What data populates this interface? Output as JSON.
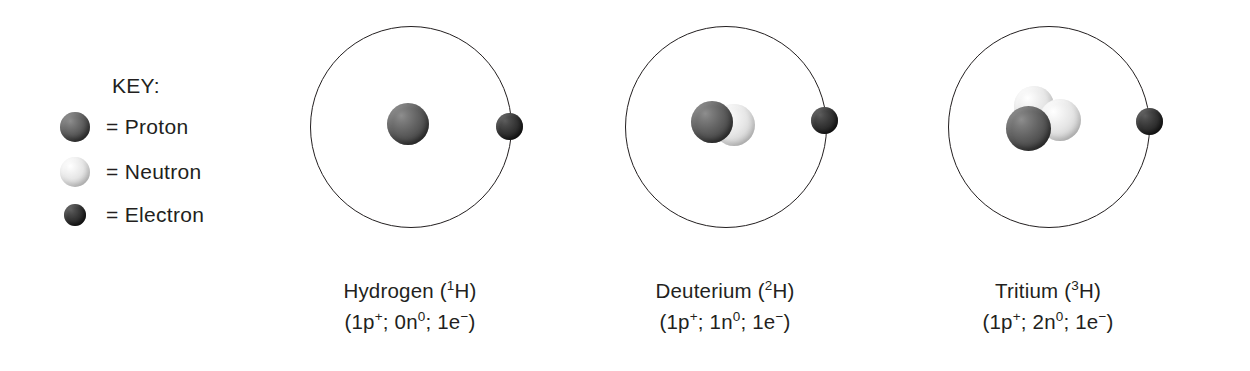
{
  "figure": {
    "background_color": "#ffffff",
    "text_color": "#231f20"
  },
  "key": {
    "title": "KEY:",
    "items": [
      {
        "icon": "proton-sphere-icon",
        "label": "= Proton",
        "color": "#4e4e4e"
      },
      {
        "icon": "neutron-sphere-icon",
        "label": "= Neutron",
        "color": "#e6e6e6"
      },
      {
        "icon": "electron-sphere-icon",
        "label": "= Electron",
        "color": "#272727"
      }
    ]
  },
  "atoms": [
    {
      "id": "hydrogen",
      "name_prefix": "Hydrogen (",
      "mass_number": "1",
      "element_symbol": "H",
      "name_suffix": ")",
      "composition_prefix": "(1p",
      "proton_charge": "+",
      "composition_mid": "; 0n",
      "neutron_charge": "0",
      "composition_mid2": "; 1e",
      "electron_charge": "−",
      "composition_suffix": ")",
      "protons": 1,
      "neutrons": 0,
      "electrons": 1
    },
    {
      "id": "deuterium",
      "name_prefix": "Deuterium (",
      "mass_number": "2",
      "element_symbol": "H",
      "name_suffix": ")",
      "composition_prefix": "(1p",
      "proton_charge": "+",
      "composition_mid": "; 1n",
      "neutron_charge": "0",
      "composition_mid2": "; 1e",
      "electron_charge": "−",
      "composition_suffix": ")",
      "protons": 1,
      "neutrons": 1,
      "electrons": 1
    },
    {
      "id": "tritium",
      "name_prefix": "Tritium (",
      "mass_number": "3",
      "element_symbol": "H",
      "name_suffix": ")",
      "composition_prefix": "(1p",
      "proton_charge": "+",
      "composition_mid": "; 2n",
      "neutron_charge": "0",
      "composition_mid2": "; 1e",
      "electron_charge": "−",
      "composition_suffix": ")",
      "protons": 1,
      "neutrons": 2,
      "electrons": 1
    }
  ]
}
